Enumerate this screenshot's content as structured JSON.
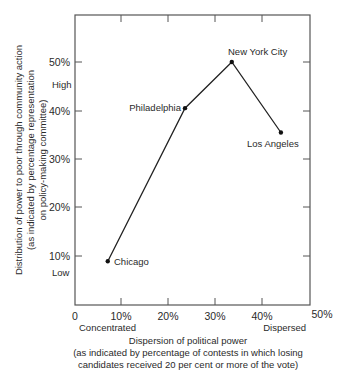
{
  "chart_data": {
    "type": "line",
    "title": "",
    "xlabel": "Dispersion of political power",
    "xlabel_sub": "(as indicated by percentage of contests in which losing",
    "xlabel_sub2": "candidates received 20 per cent or more of the vote)",
    "ylabel": "Distribution of power to poor through community action",
    "ylabel_sub": "(as indicated by percentage representation",
    "ylabel_sub2": "on policy-making committee)",
    "xlim": [
      0,
      50
    ],
    "ylim": [
      0,
      60
    ],
    "x_ticks": [
      "0",
      "10%",
      "20%",
      "30%",
      "40%",
      "50%"
    ],
    "y_ticks": [
      "10%",
      "20%",
      "30%",
      "40%",
      "50%"
    ],
    "x_annotations": {
      "low": "Concentrated",
      "high": "Dispersed"
    },
    "y_annotations": {
      "low": "Low",
      "high": "High"
    },
    "grid": false,
    "series": [
      {
        "name": "Cities",
        "points": [
          {
            "label": "Chicago",
            "x": 7,
            "y": 9
          },
          {
            "label": "Philadelphia",
            "x": 23.5,
            "y": 40.5
          },
          {
            "label": "New York City",
            "x": 33.5,
            "y": 50
          },
          {
            "label": "Los Angeles",
            "x": 44,
            "y": 35.5
          }
        ]
      }
    ]
  }
}
